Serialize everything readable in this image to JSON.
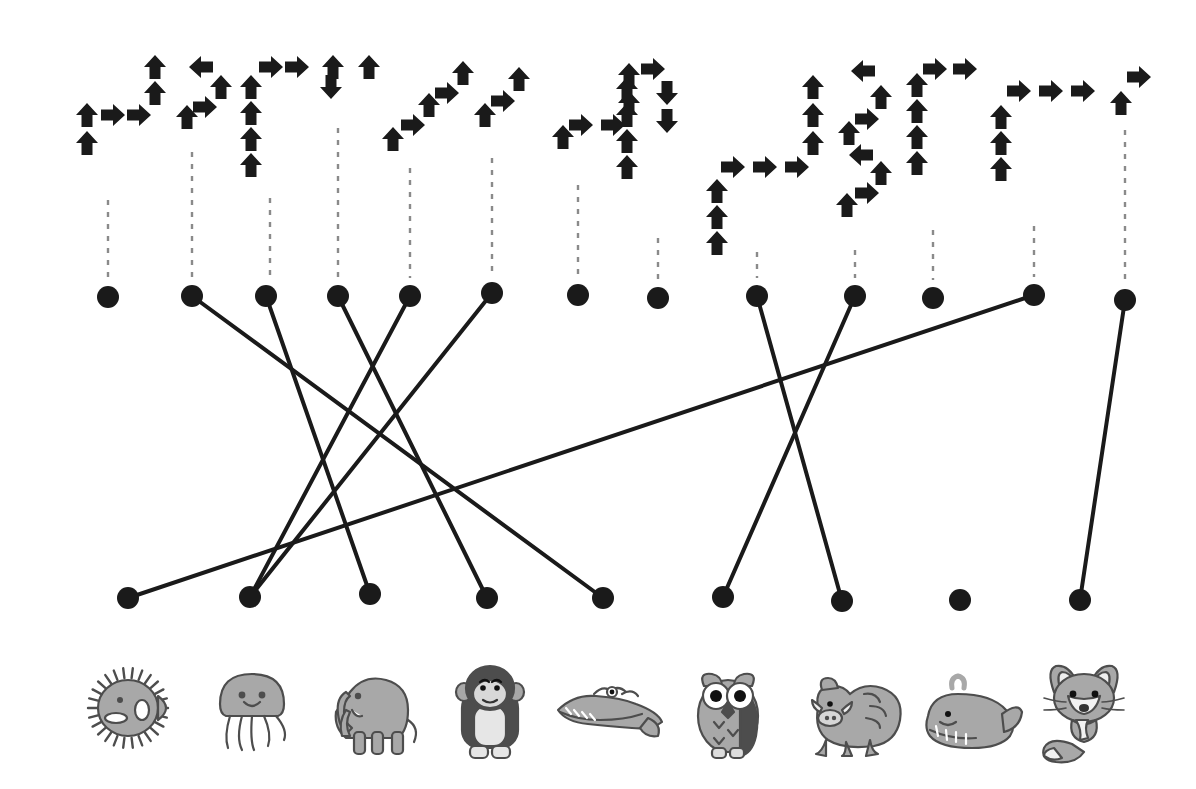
{
  "canvas": {
    "width": 1196,
    "height": 789,
    "background": "#ffffff"
  },
  "style": {
    "node_color": "#1a1a1a",
    "edge_color": "#1a1a1a",
    "arrow_color": "#1a1a1a",
    "dash_color": "#8a8a8a",
    "animal_fill": "#a8a8a8",
    "animal_stroke": "#4d4d4d",
    "node_radius": 11,
    "edge_width": 4,
    "dash_pattern": "5 7"
  },
  "top_nodes": [
    {
      "id": "t1",
      "x": 108,
      "y": 297,
      "label": "top-node-1"
    },
    {
      "id": "t2",
      "x": 192,
      "y": 296,
      "label": "top-node-2"
    },
    {
      "id": "t3",
      "x": 266,
      "y": 296,
      "label": "top-node-3"
    },
    {
      "id": "t4",
      "x": 338,
      "y": 296,
      "label": "top-node-4"
    },
    {
      "id": "t5",
      "x": 410,
      "y": 296,
      "label": "top-node-5"
    },
    {
      "id": "t6",
      "x": 492,
      "y": 293,
      "label": "top-node-6"
    },
    {
      "id": "t7",
      "x": 578,
      "y": 295,
      "label": "top-node-7"
    },
    {
      "id": "t8",
      "x": 658,
      "y": 298,
      "label": "top-node-8"
    },
    {
      "id": "t9",
      "x": 757,
      "y": 296,
      "label": "top-node-9"
    },
    {
      "id": "t10",
      "x": 855,
      "y": 296,
      "label": "top-node-10"
    },
    {
      "id": "t11",
      "x": 933,
      "y": 298,
      "label": "top-node-11"
    },
    {
      "id": "t12",
      "x": 1034,
      "y": 295,
      "label": "top-node-12"
    },
    {
      "id": "t13",
      "x": 1125,
      "y": 300,
      "label": "top-node-13"
    }
  ],
  "bottom_nodes": [
    {
      "id": "b1",
      "x": 128,
      "y": 598,
      "label": "bottom-node-1"
    },
    {
      "id": "b2",
      "x": 250,
      "y": 597,
      "label": "bottom-node-2"
    },
    {
      "id": "b3",
      "x": 370,
      "y": 594,
      "label": "bottom-node-3"
    },
    {
      "id": "b4",
      "x": 487,
      "y": 598,
      "label": "bottom-node-4"
    },
    {
      "id": "b5",
      "x": 603,
      "y": 598,
      "label": "bottom-node-5"
    },
    {
      "id": "b6",
      "x": 723,
      "y": 597,
      "label": "bottom-node-6"
    },
    {
      "id": "b7",
      "x": 842,
      "y": 601,
      "label": "bottom-node-7"
    },
    {
      "id": "b8",
      "x": 960,
      "y": 600,
      "label": "bottom-node-8"
    },
    {
      "id": "b9",
      "x": 1080,
      "y": 600,
      "label": "bottom-node-9"
    }
  ],
  "edges": [
    {
      "from": "t2",
      "to": "b5",
      "name": "edge-top2-bottom5"
    },
    {
      "from": "t3",
      "to": "b3",
      "name": "edge-top3-bottom3"
    },
    {
      "from": "t4",
      "to": "b4",
      "name": "edge-top4-bottom4"
    },
    {
      "from": "t5",
      "to": "b2",
      "name": "edge-top5-bottom2"
    },
    {
      "from": "t6",
      "to": "b2",
      "name": "edge-top6-bottom2"
    },
    {
      "from": "t9",
      "to": "b7",
      "name": "edge-top9-bottom7"
    },
    {
      "from": "t10",
      "to": "b6",
      "name": "edge-top10-bottom6"
    },
    {
      "from": "t12",
      "to": "b1",
      "name": "edge-top12-bottom1"
    },
    {
      "from": "t13",
      "to": "b9",
      "name": "edge-top13-bottom9"
    }
  ],
  "dashes": [
    {
      "x": 108,
      "y1": 200,
      "y2": 278,
      "name": "dash-1"
    },
    {
      "x": 192,
      "y1": 152,
      "y2": 278,
      "name": "dash-2"
    },
    {
      "x": 270,
      "y1": 198,
      "y2": 278,
      "name": "dash-3"
    },
    {
      "x": 338,
      "y1": 128,
      "y2": 278,
      "name": "dash-4"
    },
    {
      "x": 410,
      "y1": 168,
      "y2": 278,
      "name": "dash-5"
    },
    {
      "x": 492,
      "y1": 158,
      "y2": 276,
      "name": "dash-6"
    },
    {
      "x": 578,
      "y1": 185,
      "y2": 278,
      "name": "dash-7"
    },
    {
      "x": 658,
      "y1": 238,
      "y2": 280,
      "name": "dash-8"
    },
    {
      "x": 757,
      "y1": 252,
      "y2": 278,
      "name": "dash-9"
    },
    {
      "x": 855,
      "y1": 250,
      "y2": 278,
      "name": "dash-10"
    },
    {
      "x": 933,
      "y1": 230,
      "y2": 280,
      "name": "dash-11"
    },
    {
      "x": 1034,
      "y1": 226,
      "y2": 277,
      "name": "dash-12"
    },
    {
      "x": 1125,
      "y1": 130,
      "y2": 282,
      "name": "dash-13"
    }
  ],
  "arrow_groups": [
    {
      "name": "arrow-group-1",
      "node": "t1",
      "arrows": [
        {
          "dir": "up",
          "x": 72,
          "y": 128
        },
        {
          "dir": "up",
          "x": 72,
          "y": 100
        },
        {
          "dir": "right",
          "x": 98,
          "y": 100
        },
        {
          "dir": "right",
          "x": 124,
          "y": 100
        },
        {
          "dir": "up",
          "x": 140,
          "y": 78
        },
        {
          "dir": "up",
          "x": 140,
          "y": 52
        }
      ]
    },
    {
      "name": "arrow-group-2",
      "node": "t2",
      "arrows": [
        {
          "dir": "up",
          "x": 172,
          "y": 102
        },
        {
          "dir": "right",
          "x": 190,
          "y": 92
        },
        {
          "dir": "up",
          "x": 206,
          "y": 72
        },
        {
          "dir": "left",
          "x": 186,
          "y": 52
        }
      ]
    },
    {
      "name": "arrow-group-3",
      "node": "t3",
      "arrows": [
        {
          "dir": "up",
          "x": 236,
          "y": 150
        },
        {
          "dir": "up",
          "x": 236,
          "y": 124
        },
        {
          "dir": "up",
          "x": 236,
          "y": 98
        },
        {
          "dir": "up",
          "x": 236,
          "y": 72
        },
        {
          "dir": "right",
          "x": 256,
          "y": 52
        },
        {
          "dir": "right",
          "x": 282,
          "y": 52
        },
        {
          "dir": "down",
          "x": 316,
          "y": 72
        },
        {
          "dir": "up",
          "x": 318,
          "y": 52
        }
      ]
    },
    {
      "name": "arrow-group-4",
      "node": "t4",
      "arrows": [
        {
          "dir": "up",
          "x": 354,
          "y": 52
        }
      ]
    },
    {
      "name": "arrow-group-5",
      "node": "t5",
      "arrows": [
        {
          "dir": "up",
          "x": 378,
          "y": 124
        },
        {
          "dir": "right",
          "x": 398,
          "y": 110
        },
        {
          "dir": "up",
          "x": 414,
          "y": 90
        },
        {
          "dir": "right",
          "x": 432,
          "y": 78
        },
        {
          "dir": "up",
          "x": 448,
          "y": 58
        }
      ]
    },
    {
      "name": "arrow-group-6",
      "node": "t6",
      "arrows": [
        {
          "dir": "up",
          "x": 470,
          "y": 100
        },
        {
          "dir": "right",
          "x": 488,
          "y": 86
        },
        {
          "dir": "up",
          "x": 504,
          "y": 64
        }
      ]
    },
    {
      "name": "arrow-group-7",
      "node": "t7",
      "arrows": [
        {
          "dir": "up",
          "x": 548,
          "y": 122
        },
        {
          "dir": "right",
          "x": 566,
          "y": 110
        },
        {
          "dir": "right",
          "x": 598,
          "y": 110
        },
        {
          "dir": "up",
          "x": 614,
          "y": 88
        },
        {
          "dir": "up",
          "x": 614,
          "y": 60
        }
      ]
    },
    {
      "name": "arrow-group-8",
      "node": "t8",
      "arrows": [
        {
          "dir": "up",
          "x": 612,
          "y": 152
        },
        {
          "dir": "up",
          "x": 612,
          "y": 126
        },
        {
          "dir": "up",
          "x": 612,
          "y": 100
        },
        {
          "dir": "up",
          "x": 612,
          "y": 74
        },
        {
          "dir": "right",
          "x": 638,
          "y": 54
        },
        {
          "dir": "down",
          "x": 652,
          "y": 78
        },
        {
          "dir": "down",
          "x": 652,
          "y": 106
        }
      ]
    },
    {
      "name": "arrow-group-9",
      "node": "t9",
      "arrows": [
        {
          "dir": "up",
          "x": 702,
          "y": 228
        },
        {
          "dir": "up",
          "x": 702,
          "y": 202
        },
        {
          "dir": "up",
          "x": 702,
          "y": 176
        },
        {
          "dir": "right",
          "x": 718,
          "y": 152
        },
        {
          "dir": "right",
          "x": 750,
          "y": 152
        },
        {
          "dir": "right",
          "x": 782,
          "y": 152
        },
        {
          "dir": "up",
          "x": 798,
          "y": 128
        },
        {
          "dir": "up",
          "x": 798,
          "y": 100
        },
        {
          "dir": "up",
          "x": 798,
          "y": 72
        }
      ]
    },
    {
      "name": "arrow-group-10",
      "node": "t10",
      "arrows": [
        {
          "dir": "up",
          "x": 832,
          "y": 190
        },
        {
          "dir": "right",
          "x": 852,
          "y": 178
        },
        {
          "dir": "up",
          "x": 866,
          "y": 158
        },
        {
          "dir": "left",
          "x": 846,
          "y": 140
        },
        {
          "dir": "up",
          "x": 834,
          "y": 118
        },
        {
          "dir": "right",
          "x": 852,
          "y": 104
        },
        {
          "dir": "up",
          "x": 866,
          "y": 82
        },
        {
          "dir": "left",
          "x": 848,
          "y": 56
        }
      ]
    },
    {
      "name": "arrow-group-11",
      "node": "t11",
      "arrows": [
        {
          "dir": "up",
          "x": 902,
          "y": 148
        },
        {
          "dir": "up",
          "x": 902,
          "y": 122
        },
        {
          "dir": "up",
          "x": 902,
          "y": 96
        },
        {
          "dir": "up",
          "x": 902,
          "y": 70
        },
        {
          "dir": "right",
          "x": 920,
          "y": 54
        },
        {
          "dir": "right",
          "x": 950,
          "y": 54
        }
      ]
    },
    {
      "name": "arrow-group-12",
      "node": "t12",
      "arrows": [
        {
          "dir": "up",
          "x": 986,
          "y": 154
        },
        {
          "dir": "up",
          "x": 986,
          "y": 128
        },
        {
          "dir": "up",
          "x": 986,
          "y": 102
        },
        {
          "dir": "right",
          "x": 1004,
          "y": 76
        },
        {
          "dir": "right",
          "x": 1036,
          "y": 76
        },
        {
          "dir": "right",
          "x": 1068,
          "y": 76
        }
      ]
    },
    {
      "name": "arrow-group-13",
      "node": "t13",
      "arrows": [
        {
          "dir": "up",
          "x": 1106,
          "y": 88
        },
        {
          "dir": "right",
          "x": 1124,
          "y": 62
        }
      ]
    }
  ],
  "animals": [
    {
      "id": "a1",
      "name": "pufferfish",
      "x": 70,
      "y": 648,
      "label": "pufferfish"
    },
    {
      "id": "a2",
      "name": "jellyfish",
      "x": 192,
      "y": 648,
      "label": "jellyfish"
    },
    {
      "id": "a3",
      "name": "elephant",
      "x": 310,
      "y": 648,
      "label": "elephant"
    },
    {
      "id": "a4",
      "name": "gorilla",
      "x": 430,
      "y": 648,
      "label": "gorilla"
    },
    {
      "id": "a5",
      "name": "crocodile",
      "x": 548,
      "y": 648,
      "label": "crocodile"
    },
    {
      "id": "a6",
      "name": "owl",
      "x": 668,
      "y": 648,
      "label": "owl"
    },
    {
      "id": "a7",
      "name": "boar",
      "x": 786,
      "y": 648,
      "label": "boar"
    },
    {
      "id": "a8",
      "name": "whale",
      "x": 906,
      "y": 648,
      "label": "whale"
    },
    {
      "id": "a9",
      "name": "fox",
      "x": 1024,
      "y": 648,
      "label": "fox"
    }
  ],
  "icon_names": {
    "up": "arrow-up-icon",
    "down": "arrow-down-icon",
    "left": "arrow-left-icon",
    "right": "arrow-right-icon"
  }
}
